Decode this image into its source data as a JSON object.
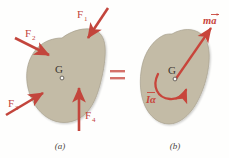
{
  "figure": {
    "background_color": "#fefefd",
    "body_fill_color": "#c3bba6",
    "body_stroke_color": "#a49c89",
    "force_color": "#c3453c",
    "arrow_color": "#c8453b",
    "label_color": "#3b352f",
    "equals_color": "#d4716a"
  },
  "panel_a": {
    "caption": "(a)",
    "center_label": "G",
    "forces": [
      {
        "name": "F1",
        "label": "F",
        "subscript": "1"
      },
      {
        "name": "F2",
        "label": "F",
        "subscript": "2"
      },
      {
        "name": "F3",
        "label": "F",
        "subscript": "3"
      },
      {
        "name": "F4",
        "label": "F",
        "subscript": "4"
      }
    ]
  },
  "equals": {
    "symbol": "="
  },
  "panel_b": {
    "caption": "(b)",
    "center_label": "G",
    "linear_term": "ma",
    "linear_term_m": "m",
    "linear_term_a": "a",
    "angular_term": "Iα",
    "angular_term_I": "I",
    "angular_term_alpha": "α"
  }
}
